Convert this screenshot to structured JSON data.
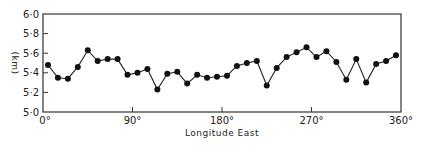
{
  "chart_data": {
    "type": "line",
    "title": "",
    "xlabel": "Longitude East",
    "ylabel": "(km)",
    "xlim": [
      0,
      360
    ],
    "ylim": [
      5.0,
      6.0
    ],
    "grid": false,
    "legend": null,
    "x_ticks": [
      0,
      90,
      180,
      270,
      360
    ],
    "x_tick_labels": [
      "0°",
      "90°",
      "180°",
      "270°",
      "360°"
    ],
    "y_ticks": [
      5.0,
      5.2,
      5.4,
      5.6,
      5.8,
      6.0
    ],
    "y_tick_labels": [
      "5·0",
      "5·2",
      "5·4",
      "5·6",
      "5·8",
      "6·0"
    ],
    "series": [
      {
        "name": "depth",
        "marker": "filled-circle",
        "x": [
          5,
          15,
          25,
          35,
          45,
          55,
          65,
          75,
          85,
          95,
          105,
          115,
          125,
          135,
          145,
          155,
          165,
          175,
          185,
          195,
          205,
          215,
          225,
          235,
          245,
          255,
          265,
          275,
          285,
          295,
          305,
          315,
          325,
          335,
          345,
          355
        ],
        "values": [
          5.48,
          5.35,
          5.34,
          5.46,
          5.63,
          5.52,
          5.54,
          5.54,
          5.38,
          5.4,
          5.44,
          5.23,
          5.39,
          5.41,
          5.29,
          5.38,
          5.35,
          5.36,
          5.37,
          5.47,
          5.5,
          5.52,
          5.27,
          5.45,
          5.56,
          5.61,
          5.66,
          5.56,
          5.62,
          5.51,
          5.33,
          5.54,
          5.3,
          5.49,
          5.52,
          5.58
        ]
      }
    ]
  },
  "labels": {
    "xlabel": "Longitude East",
    "ylabel": "(km)"
  },
  "colors": {
    "line": "#222222",
    "marker": "#111111",
    "axis": "#333333"
  }
}
